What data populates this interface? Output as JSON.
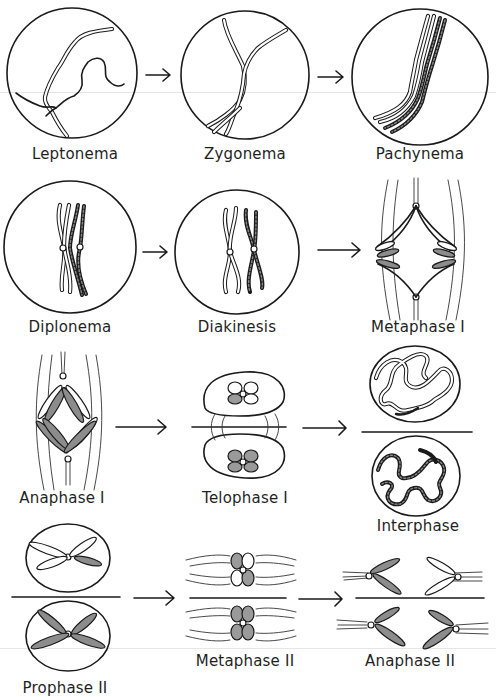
{
  "figure": {
    "stages": [
      {
        "id": "leptonema",
        "label": "Leptonema",
        "row": 1
      },
      {
        "id": "zygonema",
        "label": "Zygonema",
        "row": 1
      },
      {
        "id": "pachynema",
        "label": "Pachynema",
        "row": 1
      },
      {
        "id": "diplonema",
        "label": "Diplonema",
        "row": 2
      },
      {
        "id": "diakinesis",
        "label": "Diakinesis",
        "row": 2
      },
      {
        "id": "metaphase-1",
        "label": "Metaphase I",
        "row": 2
      },
      {
        "id": "anaphase-1",
        "label": "Anaphase I",
        "row": 3
      },
      {
        "id": "telophase-1",
        "label": "Telophase I",
        "row": 3
      },
      {
        "id": "interphase",
        "label": "Interphase",
        "row": 3
      },
      {
        "id": "prophase-2",
        "label": "Prophase II",
        "row": 4
      },
      {
        "id": "metaphase-2",
        "label": "Metaphase II",
        "row": 4
      },
      {
        "id": "anaphase-2",
        "label": "Anaphase II",
        "row": 4
      }
    ],
    "arrows": [
      {
        "from": "leptonema",
        "to": "zygonema",
        "icon": "arrow-right-icon"
      },
      {
        "from": "zygonema",
        "to": "pachynema",
        "icon": "arrow-right-icon"
      },
      {
        "from": "diplonema",
        "to": "diakinesis",
        "icon": "arrow-right-icon"
      },
      {
        "from": "diakinesis",
        "to": "metaphase-1",
        "icon": "arrow-right-icon"
      },
      {
        "from": "anaphase-1",
        "to": "telophase-1",
        "icon": "arrow-right-icon"
      },
      {
        "from": "telophase-1",
        "to": "interphase",
        "icon": "arrow-right-icon"
      },
      {
        "from": "prophase-2",
        "to": "metaphase-2",
        "icon": "arrow-right-icon"
      },
      {
        "from": "metaphase-2",
        "to": "anaphase-2",
        "icon": "arrow-right-icon"
      }
    ],
    "colors": {
      "ink": "#1a1a1a",
      "shading": "#8c8c8c",
      "background": "#ffffff"
    }
  }
}
